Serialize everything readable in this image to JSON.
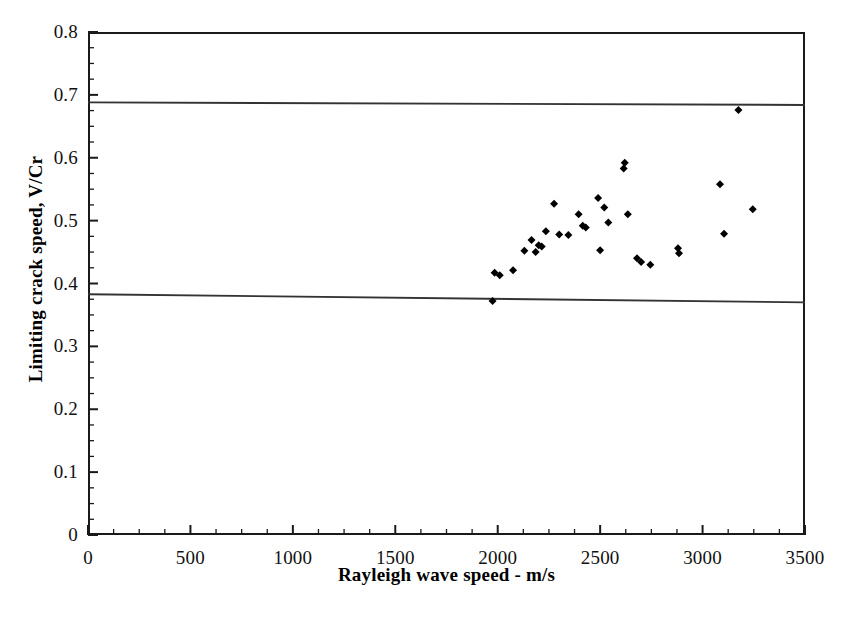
{
  "chart_data": {
    "type": "scatter",
    "title": "",
    "xlabel": "Rayleigh wave speed - m/s",
    "ylabel": "Limiting crack speed, V/Cr",
    "xlim": [
      0,
      3500
    ],
    "ylim": [
      0,
      0.8
    ],
    "xticks": [
      0,
      500,
      1000,
      1500,
      2000,
      2500,
      3000,
      3500
    ],
    "xtick_labels": [
      "0",
      "500",
      "1000",
      "1500",
      "2000",
      "2500",
      "3000",
      "3500"
    ],
    "yticks": [
      0,
      0.1,
      0.2,
      0.3,
      0.4,
      0.5,
      0.6,
      0.7,
      0.8
    ],
    "ytick_labels": [
      "0",
      "0.1",
      "0.2",
      "0.3",
      "0.4",
      "0.5",
      "0.6",
      "0.7",
      "0.8"
    ],
    "x_minor_tick_interval": 125,
    "y_minor_tick_interval": 0.025,
    "grid": false,
    "legend": null,
    "marker": "filled-diamond",
    "marker_color": "#000000",
    "marker_size_px": 8,
    "series": [
      {
        "name": "Limiting crack speed data",
        "points": [
          [
            1975,
            0.372
          ],
          [
            1985,
            0.417
          ],
          [
            2010,
            0.413
          ],
          [
            2075,
            0.421
          ],
          [
            2130,
            0.452
          ],
          [
            2165,
            0.469
          ],
          [
            2185,
            0.45
          ],
          [
            2200,
            0.461
          ],
          [
            2215,
            0.459
          ],
          [
            2235,
            0.483
          ],
          [
            2275,
            0.527
          ],
          [
            2300,
            0.478
          ],
          [
            2345,
            0.477
          ],
          [
            2395,
            0.51
          ],
          [
            2415,
            0.492
          ],
          [
            2430,
            0.489
          ],
          [
            2490,
            0.536
          ],
          [
            2500,
            0.453
          ],
          [
            2520,
            0.521
          ],
          [
            2540,
            0.497
          ],
          [
            2615,
            0.583
          ],
          [
            2620,
            0.592
          ],
          [
            2635,
            0.51
          ],
          [
            2680,
            0.44
          ],
          [
            2700,
            0.434
          ],
          [
            2745,
            0.43
          ],
          [
            2880,
            0.456
          ],
          [
            2885,
            0.448
          ],
          [
            3085,
            0.558
          ],
          [
            3105,
            0.479
          ],
          [
            3175,
            0.676
          ],
          [
            3245,
            0.518
          ]
        ]
      }
    ],
    "reference_lines": [
      {
        "name": "upper-bound-line",
        "x_start": 0,
        "y_start": 0.688,
        "x_end": 3500,
        "y_end": 0.684,
        "color": "#333333"
      },
      {
        "name": "lower-bound-line",
        "x_start": 0,
        "y_start": 0.383,
        "x_end": 3500,
        "y_end": 0.37,
        "color": "#333333"
      }
    ]
  }
}
